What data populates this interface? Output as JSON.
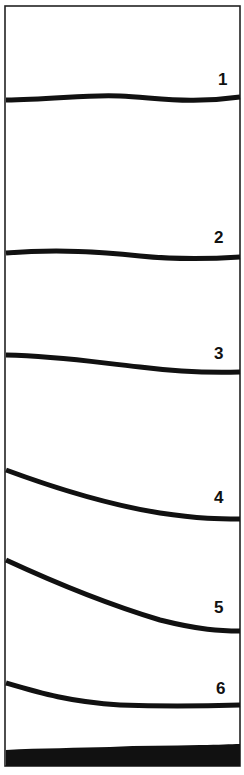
{
  "figure": {
    "frame": {
      "x": 5,
      "y": 6,
      "width": 235,
      "height": 760,
      "stroke": "#222222"
    },
    "ink_color": "#111111",
    "curves": [
      {
        "id": "1",
        "label": "1",
        "label_pos": [
          218,
          70
        ],
        "path": "M6,100 C50,100 90,94 120,96 C160,98 190,104 240,97"
      },
      {
        "id": "2",
        "label": "2",
        "label_pos": [
          214,
          228
        ],
        "path": "M6,253 C60,249 100,252 140,256 C180,260 210,259 240,257"
      },
      {
        "id": "3",
        "label": "3",
        "label_pos": [
          214,
          344
        ],
        "path": "M6,355 C60,356 100,363 140,367 C180,372 210,373 240,372"
      },
      {
        "id": "4",
        "label": "4",
        "label_pos": [
          214,
          488
        ],
        "path": "M6,470 C60,490 110,505 160,513 C200,519 220,519 240,519"
      },
      {
        "id": "5",
        "label": "5",
        "label_pos": [
          214,
          598
        ],
        "path": "M6,560 C60,585 110,605 160,620 C200,630 220,631 240,631"
      },
      {
        "id": "6",
        "label": "6",
        "label_pos": [
          216,
          679
        ],
        "path": "M6,683 C40,693 70,702 120,705 C170,707 210,706 240,705"
      }
    ],
    "base_layer": {
      "path": "M6,750 C40,748 80,748 110,747 C140,745 170,746 200,745 C220,745 230,744 240,744 L240,766 L6,766 Z"
    }
  }
}
